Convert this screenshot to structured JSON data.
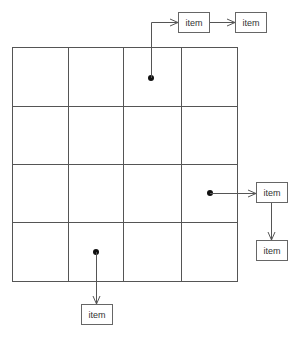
{
  "diagram": {
    "type": "grid-with-linked-items",
    "grid": {
      "rows": 4,
      "cols": 4
    },
    "items": [
      {
        "id": "top-1",
        "label": "item"
      },
      {
        "id": "top-2",
        "label": "item"
      },
      {
        "id": "right-1",
        "label": "item"
      },
      {
        "id": "right-2",
        "label": "item"
      },
      {
        "id": "bottom-1",
        "label": "item"
      }
    ],
    "links": [
      {
        "from": "cell r1c3",
        "to": "top-1"
      },
      {
        "from": "top-1",
        "to": "top-2"
      },
      {
        "from": "cell r3c4",
        "to": "right-1"
      },
      {
        "from": "right-1",
        "to": "right-2"
      },
      {
        "from": "cell r4c2",
        "to": "bottom-1"
      }
    ],
    "colors": {
      "line": "#555555",
      "dot": "#111111",
      "box_border": "#666666"
    }
  }
}
